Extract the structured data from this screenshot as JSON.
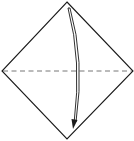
{
  "diagram": {
    "type": "origami-fold-step",
    "caption": "",
    "paper": {
      "shape": "square rotated 45° (diamond)",
      "stroke_color": "#1a1a1a",
      "fill_color": "#ffffff"
    },
    "fold_line": {
      "style": "valley fold (dashed)",
      "orientation": "horizontal",
      "color": "#555555"
    },
    "arrow": {
      "direction": "top corner folds down to bottom corner",
      "style": "curved double-line arrow with solid head",
      "color": "#1a1a1a"
    }
  }
}
